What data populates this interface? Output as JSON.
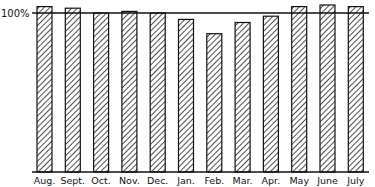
{
  "chart_data": {
    "type": "bar",
    "title": "",
    "xlabel": "",
    "ylabel": "",
    "reference_line": {
      "value": 100,
      "label": "100%"
    },
    "categories": [
      "Aug.",
      "Sept.",
      "Oct.",
      "Nov.",
      "Dec.",
      "Jan.",
      "Feb.",
      "Mar.",
      "Apr.",
      "May",
      "June",
      "July"
    ],
    "values": [
      104,
      103,
      100,
      101,
      100,
      96,
      87,
      94,
      98,
      104,
      105,
      104
    ],
    "ylim": [
      0,
      108
    ],
    "grid": false,
    "legend": null,
    "style": {
      "bar_fill": "diagonal-hatch",
      "bar_stroke": "#111111",
      "line_color": "#111111"
    }
  }
}
